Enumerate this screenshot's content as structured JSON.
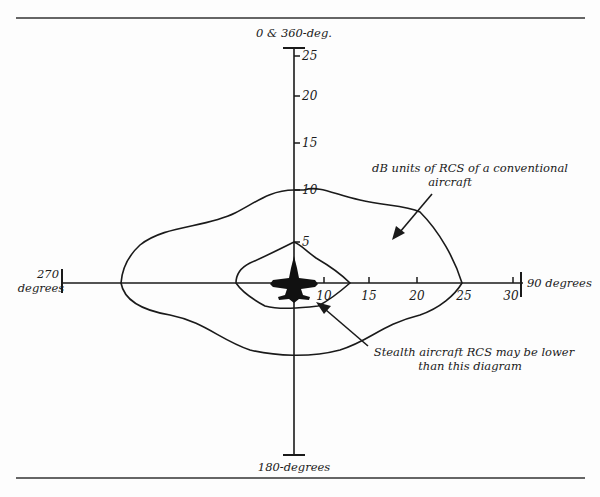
{
  "figure": {
    "type": "radar cross section polar diagram",
    "top_rule": true,
    "bottom_rule": true
  },
  "axes": {
    "top_label": "0 & 360-deg.",
    "bottom_label": "180-degrees",
    "left_label_line1": "270",
    "left_label_line2": "degrees",
    "right_label": "90 degrees",
    "vertical_ticks": [
      "5",
      "10",
      "15",
      "20",
      "25"
    ],
    "horizontal_ticks": [
      "10",
      "15",
      "20",
      "25",
      "30"
    ]
  },
  "annotations": {
    "conventional_line1": "dB units of RCS of a conventional",
    "conventional_line2": "aircraft",
    "stealth_line1": "Stealth aircraft RCS may be lower",
    "stealth_line2": "than this diagram"
  },
  "contours": [
    {
      "name": "conventional aircraft RCS",
      "description": "large outer lobe; ~10 dB at nose, ~25 dB at 90 degrees, ~24 at 270 degrees, ~-9 at tail"
    },
    {
      "name": "stealth aircraft RCS",
      "description": "small inner diamond; ~5 dB at nose, ~12 dB at 90 degrees, ~7 at 270 degrees, ~-3 at tail"
    }
  ],
  "icons": {
    "aircraft": "aircraft-silhouette-icon"
  },
  "colors": {
    "ink": "#1a1a1a",
    "paper": "#fdfdfd"
  }
}
